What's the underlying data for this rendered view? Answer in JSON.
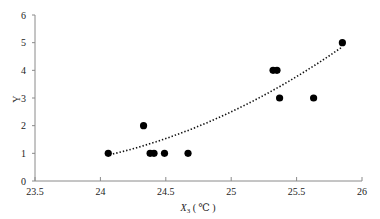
{
  "chart_data": {
    "type": "scatter",
    "title": "",
    "xlabel": "X3 ( ℃ )",
    "xlabel_main": "X",
    "xlabel_sub": "3",
    "xlabel_unit": " ( ℃ )",
    "ylabel": "Y",
    "xlim": [
      23.5,
      26
    ],
    "ylim": [
      0,
      6
    ],
    "x_ticks": [
      "23.5",
      "24",
      "24.5",
      "25",
      "25.5",
      "26"
    ],
    "y_ticks": [
      "0",
      "1",
      "2",
      "3",
      "4",
      "5",
      "6"
    ],
    "grid": false,
    "legend": null,
    "series": [
      {
        "name": "observations",
        "marker": "filled-circle",
        "color": "#000000",
        "points": [
          {
            "x": 24.06,
            "y": 1
          },
          {
            "x": 24.33,
            "y": 2
          },
          {
            "x": 24.38,
            "y": 1
          },
          {
            "x": 24.41,
            "y": 1
          },
          {
            "x": 24.49,
            "y": 1
          },
          {
            "x": 24.67,
            "y": 1
          },
          {
            "x": 25.32,
            "y": 4
          },
          {
            "x": 25.35,
            "y": 4
          },
          {
            "x": 25.37,
            "y": 3
          },
          {
            "x": 25.63,
            "y": 3
          },
          {
            "x": 25.85,
            "y": 5
          }
        ]
      }
    ],
    "trendline": {
      "type": "polynomial (order 2)",
      "style": "dotted",
      "color": "#111111",
      "x_range": [
        24.07,
        25.85
      ],
      "y_start": 0.95,
      "y_end": 4.85,
      "coefficients_about_x0": {
        "x0": 24.07,
        "a": 0.617,
        "b": 1.093,
        "c": 0.95
      }
    }
  }
}
